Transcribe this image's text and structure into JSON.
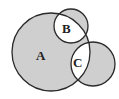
{
  "diagram": {
    "type": "venn",
    "colors": {
      "shade": "#cfcfcf",
      "stroke": "#2a2a2a",
      "background": "#ffffff"
    },
    "sets": [
      {
        "id": "A",
        "label": "A",
        "cx": 51,
        "cy": 52,
        "r": 39,
        "label_x": 41,
        "label_y": 60
      },
      {
        "id": "B",
        "label": "B",
        "cx": 71,
        "cy": 26,
        "r": 17,
        "label_x": 66,
        "label_y": 32
      },
      {
        "id": "C",
        "label": "C",
        "cx": 93,
        "cy": 64,
        "r": 22,
        "label_x": 77,
        "label_y": 66
      }
    ],
    "shaded_regions": [
      "A only",
      "B only",
      "C only"
    ],
    "unshaded_regions": [
      "A∩B",
      "A∩C"
    ]
  }
}
